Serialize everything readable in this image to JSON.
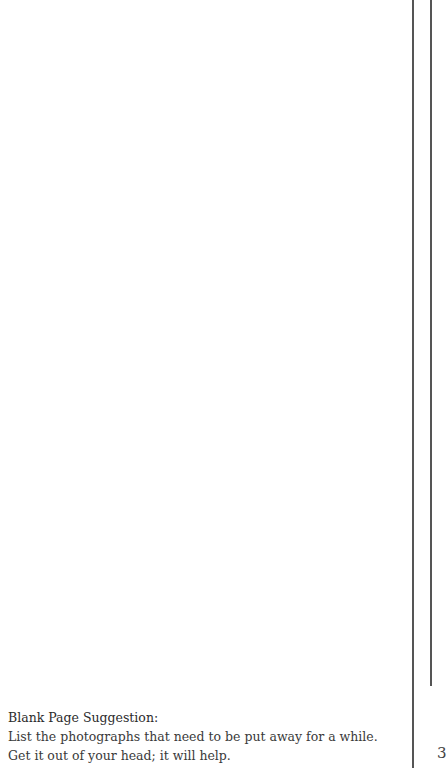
{
  "page": {
    "suggestion_title": "Blank Page Suggestion:",
    "suggestion_text": "List the photographs that need to be put away for a while. Get it out of your head; it will help.",
    "page_number": "3"
  }
}
